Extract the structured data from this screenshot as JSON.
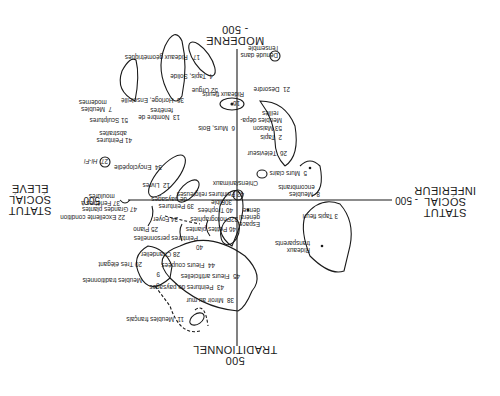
{
  "axes": {
    "top": {
      "title": "TRADITIONNEL",
      "tick": "500"
    },
    "bottom": {
      "title": "MODERNE",
      "tick": "- 500"
    },
    "left": {
      "title_lines": [
        "STATUT",
        "SOCIAL",
        "INFÉRIEUR"
      ],
      "tick": "- 500"
    },
    "right": {
      "title_lines": [
        "STATUT",
        "SOCIAL",
        "ÉLEVÉ"
      ],
      "tick": "500"
    }
  },
  "items": [
    {
      "id": "11",
      "label": "Meubles français"
    },
    {
      "id": "38",
      "label": "Miroir au mur"
    },
    {
      "id": "43",
      "label": "Peintures de paysages"
    },
    {
      "id": "45",
      "label": "Fleurs artificielles"
    },
    {
      "id": "44",
      "label": "Fleurs coupées"
    },
    {
      "id": "9",
      "label": "Meubles traditionnels"
    },
    {
      "id": "20",
      "label": "Très élégant"
    },
    {
      "id": "28",
      "label": "Chandelier"
    },
    {
      "id": "40a",
      "label": "40"
    },
    {
      "id": "pp",
      "label": "Peintures personnelles"
    },
    {
      "id": "25",
      "label": "Piano"
    },
    {
      "id": "46",
      "label": "Petites plantes"
    },
    {
      "id": "22",
      "label": "Excellente condition"
    },
    {
      "id": "24",
      "label": "Foyer"
    },
    {
      "id": "32",
      "label": "Photographies"
    },
    {
      "id": "47",
      "label": "Grandes plantes"
    },
    {
      "id": "40",
      "label": "Trophées"
    },
    {
      "id": "39",
      "label": "Peintures de paysages"
    },
    {
      "id": "30",
      "label": "Bible"
    },
    {
      "id": "37",
      "label": "Fenêtres à moulures"
    },
    {
      "id": "eg",
      "label": "Espace général dense"
    },
    {
      "id": "rt",
      "label": "Rideaux transparents"
    },
    {
      "id": "3",
      "label": "Tapis fleuri"
    },
    {
      "id": "8",
      "label": "Meubles encombrants"
    },
    {
      "id": "42",
      "label": "Peintures religieuses"
    },
    {
      "id": "12",
      "label": "Livres"
    },
    {
      "id": "34",
      "label": "Encyclopédie"
    },
    {
      "id": "27",
      "label": "Hi-Fi"
    },
    {
      "id": "ca",
      "label": "Chiens/animaux"
    },
    {
      "id": "5",
      "label": "Murs clairs"
    },
    {
      "id": "26",
      "label": "Téléviseur"
    },
    {
      "id": "2",
      "label": "Tapis"
    },
    {
      "id": "53",
      "label": "Maison"
    },
    {
      "id": "md",
      "label": "Meubles dépareillés"
    },
    {
      "id": "6",
      "label": "Murs, Bois"
    },
    {
      "id": "16",
      "label": "16"
    },
    {
      "id": "rf",
      "label": "Rideaux fleuris"
    },
    {
      "id": "21",
      "label": "Désordre"
    },
    {
      "id": "18",
      "label": "Dénudé dans l'ensemble"
    },
    {
      "id": "13",
      "label": "Nombre de fenêtres"
    },
    {
      "id": "41",
      "label": "Peintures abstraites"
    },
    {
      "id": "51",
      "label": "Sculptures"
    },
    {
      "id": "7",
      "label": "Meubles modernes"
    },
    {
      "id": "36",
      "label": "Horloge, Ensoleillé"
    },
    {
      "id": "52",
      "label": "Orgue"
    },
    {
      "id": "4",
      "label": "Tapis, Solide"
    },
    {
      "id": "17",
      "label": "Rideaux géométriques"
    }
  ],
  "text": {
    "t11": "11",
    "t11l": "Meubles français",
    "t38": "38",
    "t38l": "Miroir au mur",
    "t43": "43",
    "t43l": "Peintures de paysages",
    "t45": "45",
    "t45l": "Fleurs artificielles",
    "t44": "44",
    "t44l": "Fleurs coupées",
    "t9": "9",
    "t9l": "Meubles traditionnels",
    "t20": "20",
    "t20l": "Très élégant",
    "t28": "28",
    "t28l": "Chandelier",
    "t40a": "40",
    "tpp": "Peintures personnelles",
    "t25": "25",
    "t25l": "Piano",
    "t46": "46",
    "t46l": "Petites plantes",
    "t22": "22",
    "t22l": "Excellente condition",
    "t24": "24",
    "t24l": "Foyer",
    "t32": "32",
    "t32l": "Photographies",
    "t47": "47",
    "t47l": "Grandes plantes",
    "t40": "40",
    "t40l": "Trophées",
    "t39": "39",
    "t39l1": "Peintures",
    "t39l2": "de paysages",
    "t30": "30",
    "t30l": "Bible",
    "t37": "37",
    "t37l1": "Fenêtres à",
    "t37l2": "moulures",
    "teg1": "Espace",
    "teg2": "général",
    "teg3": "dense",
    "trt1": "Rideaux",
    "trt2": "transparents",
    "t3": "3",
    "t3l": "Tapis fleuri",
    "t8": "8",
    "t8l1": "Meubles",
    "t8l2": "encombrants",
    "t42": "42",
    "t42l": "Peintures religieuses",
    "t12": "12",
    "t12l": "Livres",
    "t34": "34",
    "t34l": "Encyclopédie",
    "t27": "27",
    "t27l": "Hi-Fi",
    "tca": "Chiens/animaux",
    "t5": "5",
    "t5l": "Murs clairs",
    "t26": "26",
    "t26l": "Téléviseur",
    "t2": "2",
    "t2l": "Tapis",
    "t53": "53",
    "t53l": "Maison",
    "tmd1": "Meubles dépa-",
    "tmd2": "reillés",
    "t6": "6",
    "t6l": "Murs, Bois",
    "t16": "16",
    "trf": "Rideaux fleuris",
    "t21": "21",
    "t21l": "Désordre",
    "t18": "18",
    "t18l1": "Dénudé dans",
    "t18l2": "l'ensemble",
    "t13": "13",
    "t13l1": "Nombre de",
    "t13l2": "fenêtres",
    "t41": "41",
    "t41l1": "Peintures",
    "t41l2": "abstraites",
    "t51": "51",
    "t51l": "Sculptures",
    "t7": "7",
    "t7l1": "Meubles",
    "t7l2": "modernes",
    "t36": "36",
    "t36l": "Horloge, Ensoleillé",
    "t52": "52",
    "t52l": "Orgue",
    "t4": "4",
    "t4l": "Tapis, Solide",
    "t17": "17",
    "t17l": "Rideaux géométriques"
  }
}
